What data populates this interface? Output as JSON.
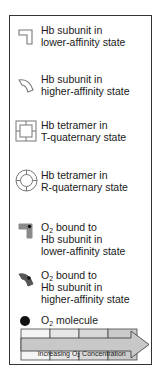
{
  "legend": {
    "items": [
      {
        "icon": "hb-subunit-lower-affinity-icon",
        "lines": [
          "Hb subunit in",
          "lower-affinity state"
        ]
      },
      {
        "icon": "hb-subunit-higher-affinity-icon",
        "lines": [
          "Hb subunit in",
          "higher-affinity state"
        ]
      },
      {
        "icon": "hb-tetramer-t-state-icon",
        "lines": [
          "Hb tetramer in",
          "T-quaternary state"
        ]
      },
      {
        "icon": "hb-tetramer-r-state-icon",
        "lines": [
          "Hb tetramer in",
          "R-quaternary state"
        ]
      },
      {
        "icon": "o2-bound-lower-affinity-icon",
        "o2_prefix": "O",
        "o2_sub": "2",
        "lines": [
          " bound to",
          "Hb subunit in",
          "lower-affinity state"
        ]
      },
      {
        "icon": "o2-bound-higher-affinity-icon",
        "o2_prefix": "O",
        "o2_sub": "2",
        "lines": [
          " bound to",
          "Hb subunit in",
          "higher-affinity state"
        ]
      },
      {
        "icon": "o2-molecule-icon",
        "o2_prefix": "O",
        "o2_sub": "2",
        "lines": [
          " molecule"
        ]
      }
    ],
    "gradient_bar": {
      "label_before": "Increasing O",
      "label_sub": "2",
      "label_after": " Concentration",
      "segments": 4,
      "colors": [
        "#f4f4f4",
        "#e6e6e6",
        "#d8d8d8",
        "#cacaca"
      ]
    }
  }
}
